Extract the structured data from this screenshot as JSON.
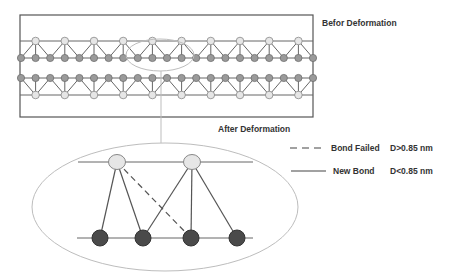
{
  "titles": {
    "before": "Befor Deformation",
    "after": "After Deformation"
  },
  "legend": [
    {
      "line_style": "dashed",
      "label": "Bond Failed",
      "condition": "D>0.85 nm"
    },
    {
      "line_style": "solid",
      "label": "New Bond",
      "condition": "D<0.85 nm"
    }
  ],
  "colors": {
    "frame": "#555555",
    "bond": "#666666",
    "light_node_fill": "#e6e6e6",
    "light_node_stroke": "#888888",
    "gray_node_fill": "#9a9a9a",
    "gray_node_stroke": "#6f6f6f",
    "dark_node_fill": "#4a4a4a",
    "dark_node_stroke": "#333333",
    "ellipse": "#bdbdbd",
    "text": "#333333"
  },
  "before_structure": {
    "frame": {
      "x": 20,
      "y": 15,
      "width": 293,
      "height": 102
    },
    "rows": {
      "top_line_y": 41,
      "upper_gray_y": 58,
      "lower_gray_y": 78,
      "bottom_line_y": 95
    },
    "gray_node_count": 21,
    "gray_start_x": 21,
    "gray_spacing": 14.6,
    "light_node_count": 10
  },
  "zoom_region": {
    "small_ellipse": {
      "cx": 160,
      "cy": 55,
      "rx": 34,
      "ry": 16
    },
    "connector": {
      "x": 161,
      "y1": 71,
      "y2": 143
    },
    "big_ellipse": {
      "cx": 165,
      "cy": 207,
      "rx": 133,
      "ry": 64
    }
  },
  "after_structure": {
    "top_line": {
      "x1": 78,
      "x2": 253,
      "y": 162
    },
    "bottom_line": {
      "x1": 77,
      "x2": 253,
      "y": 238
    },
    "top_nodes": [
      {
        "x": 117,
        "y": 162
      },
      {
        "x": 192,
        "y": 162
      }
    ],
    "bottom_nodes": [
      {
        "x": 100,
        "y": 238
      },
      {
        "x": 143,
        "y": 238
      },
      {
        "x": 191,
        "y": 238
      },
      {
        "x": 237,
        "y": 238
      }
    ],
    "solid_bonds": [
      [
        0,
        0
      ],
      [
        0,
        1
      ],
      [
        1,
        1
      ],
      [
        1,
        2
      ],
      [
        1,
        3
      ]
    ],
    "dashed_bonds": [
      [
        0,
        2
      ]
    ]
  }
}
